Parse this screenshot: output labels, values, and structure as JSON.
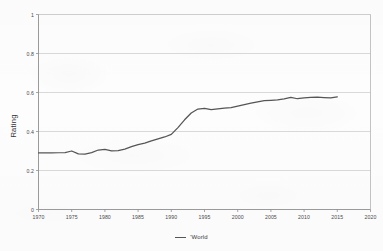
{
  "chart_data": {
    "type": "line",
    "title": "",
    "xlabel": "",
    "ylabel": "Rating",
    "xlim": [
      1970,
      2020
    ],
    "ylim": [
      0,
      1
    ],
    "grid": true,
    "legend_position": "bottom",
    "x_ticks": [
      "1970",
      "1975",
      "1980",
      "1985",
      "1990",
      "1995",
      "2000",
      "2005",
      "2010",
      "2015",
      "2020"
    ],
    "x_tick_values": [
      1970,
      1975,
      1980,
      1985,
      1990,
      1995,
      2000,
      2005,
      2010,
      2015,
      2020
    ],
    "y_ticks": [
      "0",
      "0.2",
      "0.4",
      "0.6",
      "0.8",
      "1"
    ],
    "y_tick_values": [
      0,
      0.2,
      0.4,
      0.6,
      0.8,
      1
    ],
    "series": [
      {
        "name": "'World",
        "color": "#555555",
        "x": [
          1970,
          1971,
          1972,
          1973,
          1974,
          1975,
          1976,
          1977,
          1978,
          1979,
          1980,
          1981,
          1982,
          1983,
          1984,
          1985,
          1986,
          1987,
          1988,
          1989,
          1990,
          1991,
          1992,
          1993,
          1994,
          1995,
          1996,
          1997,
          1998,
          1999,
          2000,
          2001,
          2002,
          2003,
          2004,
          2005,
          2006,
          2007,
          2008,
          2009,
          2010,
          2011,
          2012,
          2013,
          2014,
          2015
        ],
        "values": [
          0.29,
          0.29,
          0.29,
          0.291,
          0.292,
          0.3,
          0.285,
          0.284,
          0.292,
          0.305,
          0.308,
          0.301,
          0.302,
          0.31,
          0.322,
          0.333,
          0.34,
          0.352,
          0.362,
          0.372,
          0.385,
          0.42,
          0.46,
          0.495,
          0.515,
          0.518,
          0.512,
          0.516,
          0.52,
          0.522,
          0.53,
          0.538,
          0.545,
          0.552,
          0.558,
          0.56,
          0.562,
          0.567,
          0.575,
          0.568,
          0.572,
          0.575,
          0.576,
          0.574,
          0.572,
          0.578
        ]
      }
    ]
  },
  "legend": {
    "entries": [
      {
        "label": "'World"
      }
    ]
  },
  "axes": {
    "y_title": "Rating"
  }
}
